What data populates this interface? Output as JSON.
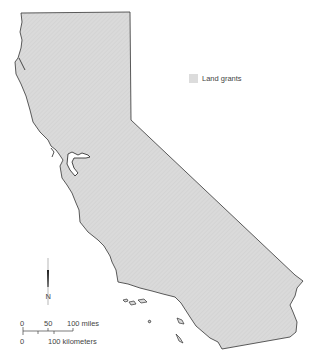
{
  "map": {
    "subject": "California",
    "fill_color": "#d9d9d9",
    "outline_color": "#333333"
  },
  "legend": {
    "items": [
      {
        "label": "Land grants",
        "color": "#dcdcdc"
      }
    ]
  },
  "north_arrow": {
    "label": "N"
  },
  "scale_bar": {
    "miles": {
      "ticks": [
        "0",
        "50",
        "100 miles"
      ]
    },
    "kilometers": {
      "ticks": [
        "0",
        "100 kilometers"
      ]
    }
  }
}
